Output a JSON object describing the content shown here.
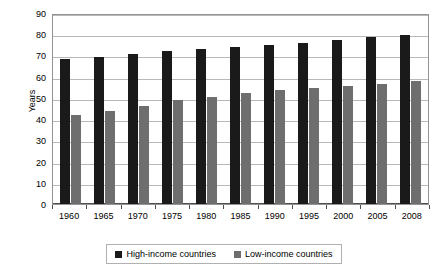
{
  "chart_data": {
    "type": "bar",
    "title": "",
    "subtitle": "",
    "xlabel": "",
    "ylabel": "Years",
    "ylim": [
      0,
      90
    ],
    "y_ticks": [
      0,
      10,
      20,
      30,
      40,
      50,
      60,
      70,
      80,
      90
    ],
    "grid": true,
    "legend_position": "bottom",
    "categories": [
      "1960",
      "1965",
      "1970",
      "1975",
      "1980",
      "1985",
      "1990",
      "1995",
      "2000",
      "2005",
      "2008"
    ],
    "series": [
      {
        "name": "High-income countries",
        "color": "#1a1a1a",
        "values": [
          68.5,
          69.5,
          70.5,
          72,
          73,
          74,
          75,
          76,
          77.5,
          78.5,
          79.5
        ]
      },
      {
        "name": "Low-income countries",
        "color": "#6e6e6e",
        "values": [
          42,
          44,
          46,
          49,
          50.5,
          52.5,
          53.5,
          54.5,
          55.5,
          56.5,
          58
        ]
      }
    ]
  },
  "axis": {
    "y_title": "Years"
  },
  "legend": {
    "items": [
      {
        "label": "High-income countries",
        "color": "#1a1a1a"
      },
      {
        "label": "Low-income countries",
        "color": "#6e6e6e"
      }
    ]
  }
}
